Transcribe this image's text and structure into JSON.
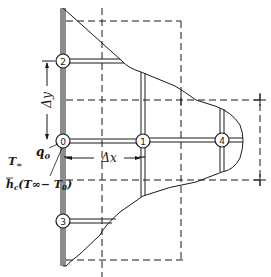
{
  "diagram": {
    "type": "finite-difference nodal network on irregular boundary",
    "colors": {
      "ink": "#1a1a1a",
      "background": "#ffffff"
    },
    "nodes": [
      {
        "id": "0",
        "label": "0",
        "x": 63,
        "y": 141
      },
      {
        "id": "1",
        "label": "1",
        "x": 143,
        "y": 141
      },
      {
        "id": "2",
        "label": "2",
        "x": 63,
        "y": 61
      },
      {
        "id": "3",
        "label": "3",
        "x": 63,
        "y": 221
      },
      {
        "id": "4",
        "label": "4",
        "x": 222,
        "y": 140
      }
    ],
    "labels": {
      "delta_y": "Δy",
      "delta_x": "Δx",
      "q0": "q",
      "q0_sub": "0",
      "t_inf": "T",
      "t_inf_sub": "∞",
      "hc_expr_h": "h",
      "hc_expr_sub": "c",
      "hc_expr_rest": "(T∞− T",
      "hc_expr_sub0": "0",
      "hc_expr_close": ")"
    }
  }
}
